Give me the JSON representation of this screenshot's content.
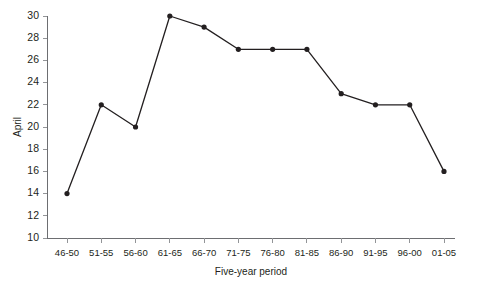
{
  "chart_data": {
    "type": "line",
    "title": "",
    "xlabel": "Five-year period",
    "ylabel": "April",
    "categories": [
      "46-50",
      "51-55",
      "56-60",
      "61-65",
      "66-70",
      "71-75",
      "76-80",
      "81-85",
      "86-90",
      "91-95",
      "96-00",
      "01-05"
    ],
    "values": [
      14,
      22,
      20,
      30,
      29,
      27,
      27,
      27,
      23,
      22,
      22,
      16
    ],
    "ylim": [
      10,
      30
    ],
    "yticks": [
      10,
      12,
      14,
      16,
      18,
      20,
      22,
      24,
      26,
      28,
      30
    ],
    "ytick_labels": [
      "10",
      "12",
      "14",
      "16",
      "18",
      "20",
      "22",
      "24",
      "26",
      "28",
      "30"
    ],
    "grid": false,
    "legend": false,
    "marker": "circle",
    "line_color": "#231f20",
    "marker_color": "#231f20",
    "axis_color": "#6d6e71",
    "tick_color": "#939598",
    "background": "#ffffff"
  }
}
